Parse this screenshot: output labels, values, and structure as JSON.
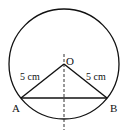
{
  "diagram": {
    "type": "geometry",
    "colors": {
      "stroke": "#111111",
      "background": "#ffffff"
    },
    "circle": {
      "cx": 64,
      "cy": 64,
      "r": 55
    },
    "points": {
      "O": {
        "label": "O",
        "x": 64,
        "y": 64
      },
      "A": {
        "label": "A",
        "x": 21,
        "y": 98
      },
      "B": {
        "label": "B",
        "x": 107,
        "y": 98
      }
    },
    "segments": [
      {
        "from": "O",
        "to": "A",
        "label": "5 cm"
      },
      {
        "from": "O",
        "to": "B",
        "label": "5 cm"
      },
      {
        "from": "A",
        "to": "B",
        "label": ""
      }
    ],
    "dashed_line": {
      "x": 64,
      "y1": 54,
      "y2": 130
    },
    "labels": {
      "center": "O",
      "point_a": "A",
      "point_b": "B",
      "radius_left": "5 cm",
      "radius_right": "5 cm"
    }
  }
}
